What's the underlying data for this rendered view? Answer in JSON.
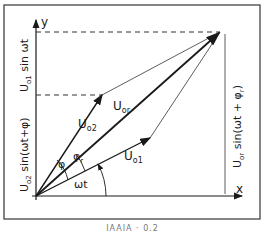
{
  "diagram": {
    "type": "phasor-diagram",
    "axes": {
      "x_label": "x",
      "y_label": "y"
    },
    "vectors": {
      "u1": {
        "label_main": "U",
        "label_sub": "o1"
      },
      "u2": {
        "label_main": "U",
        "label_sub": "o2"
      },
      "ur": {
        "label_main": "U",
        "label_sub": "or"
      }
    },
    "angles": {
      "omega_t": "ωt",
      "phi": "φ",
      "phi_r": "φ",
      "phi_r_sub": "r"
    },
    "projections": {
      "left_top": "U",
      "left_top_sub": "o1",
      "left_top_rest": " sin ωt",
      "left_bottom": "U",
      "left_bottom_sub": "o2",
      "left_bottom_rest": " sin(ωt+φ)",
      "right_main": "U",
      "right_sub": "or",
      "right_rest": " sin(ωt + φ",
      "right_rest_sub": "r",
      "right_rest_end": ")"
    }
  },
  "caption": "IAAIA · 0.2"
}
